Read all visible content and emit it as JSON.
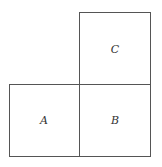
{
  "diagram": {
    "squares": [
      {
        "id": "A",
        "label": "A"
      },
      {
        "id": "B",
        "label": "B"
      },
      {
        "id": "C",
        "label": "C"
      }
    ]
  }
}
